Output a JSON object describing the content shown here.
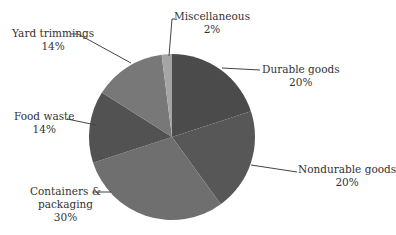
{
  "chart_data": {
    "type": "pie",
    "title": "",
    "categories": [
      "Durable goods",
      "Nondurable goods",
      "Containers & packaging",
      "Food waste",
      "Yard trimmings",
      "Miscellaneous"
    ],
    "values": [
      20,
      20,
      30,
      14,
      14,
      2
    ],
    "unit": "%",
    "colors": [
      "#4b4b4b",
      "#575757",
      "#6f6f6f",
      "#525252",
      "#787878",
      "#a5a5a5"
    ],
    "start_angle_deg": 0,
    "direction": "clockwise",
    "legend": "none",
    "labels": [
      {
        "name": "Durable goods",
        "value": "20%"
      },
      {
        "name": "Nondurable goods",
        "value": "20%"
      },
      {
        "name": "Containers &",
        "name2": "packaging",
        "value": "30%"
      },
      {
        "name": "Food waste",
        "value": "14%"
      },
      {
        "name": "Yard trimmings",
        "value": "14%"
      },
      {
        "name": "Miscellaneous",
        "value": "2%"
      }
    ]
  }
}
